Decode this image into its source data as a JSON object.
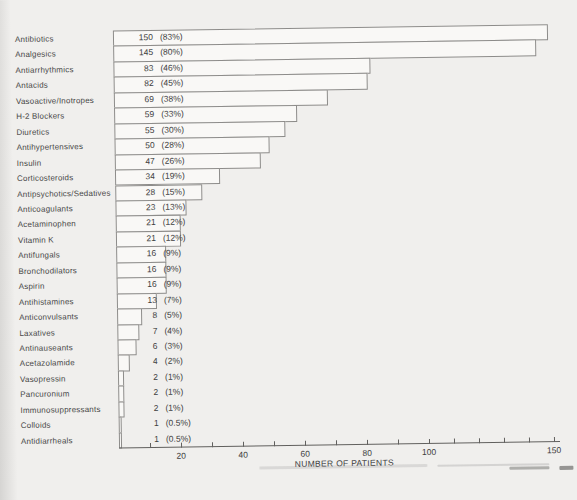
{
  "chart_data": {
    "type": "bar",
    "orientation": "horizontal",
    "title": "",
    "xlabel": "NUMBER OF PATIENTS",
    "ylabel": "",
    "xlim": [
      0,
      150
    ],
    "xticks_labeled": [
      20,
      40,
      60,
      80,
      100,
      150
    ],
    "xtick_minor_step": 10,
    "grid": false,
    "legend": false,
    "bar_fill_color": "#f9f8f6",
    "bar_border_color": "#8d8c8a",
    "rows": [
      {
        "category": "Antibiotics",
        "patients": 150,
        "pct_label": "(83%)"
      },
      {
        "category": "Analgesics",
        "patients": 145,
        "pct_label": "(80%)"
      },
      {
        "category": "Antiarrhythmics",
        "patients": 83,
        "pct_label": "(46%)"
      },
      {
        "category": "Antacids",
        "patients": 82,
        "pct_label": "(45%)"
      },
      {
        "category": "Vasoactive/Inotropes",
        "patients": 69,
        "pct_label": "(38%)"
      },
      {
        "category": "H-2 Blockers",
        "patients": 59,
        "pct_label": "(33%)"
      },
      {
        "category": "Diuretics",
        "patients": 55,
        "pct_label": "(30%)"
      },
      {
        "category": "Antihypertensives",
        "patients": 50,
        "pct_label": "(28%)"
      },
      {
        "category": "Insulin",
        "patients": 47,
        "pct_label": "(26%)"
      },
      {
        "category": "Corticosteroids",
        "patients": 34,
        "pct_label": "(19%)"
      },
      {
        "category": "Antipsychotics/Sedatives",
        "patients": 28,
        "pct_label": "(15%)"
      },
      {
        "category": "Anticoagulants",
        "patients": 23,
        "pct_label": "(13%)"
      },
      {
        "category": "Acetaminophen",
        "patients": 21,
        "pct_label": "(12%)"
      },
      {
        "category": "Vitamin K",
        "patients": 21,
        "pct_label": "(12%)"
      },
      {
        "category": "Antifungals",
        "patients": 16,
        "pct_label": "(9%)"
      },
      {
        "category": "Bronchodilators",
        "patients": 16,
        "pct_label": "(9%)"
      },
      {
        "category": "Aspirin",
        "patients": 16,
        "pct_label": "(9%)"
      },
      {
        "category": "Antihistamines",
        "patients": 13,
        "pct_label": "(7%)"
      },
      {
        "category": "Anticonvulsants",
        "patients": 8,
        "pct_label": "(5%)"
      },
      {
        "category": "Laxatives",
        "patients": 7,
        "pct_label": "(4%)"
      },
      {
        "category": "Antinauseants",
        "patients": 6,
        "pct_label": "(3%)"
      },
      {
        "category": "Acetazolamide",
        "patients": 4,
        "pct_label": "(2%)"
      },
      {
        "category": "Vasopressin",
        "patients": 2,
        "pct_label": "(1%)"
      },
      {
        "category": "Pancuronium",
        "patients": 2,
        "pct_label": "(1%)"
      },
      {
        "category": "Immunosuppressants",
        "patients": 2,
        "pct_label": "(1%)"
      },
      {
        "category": "Colloids",
        "patients": 1,
        "pct_label": "(0.5%)"
      },
      {
        "category": "Antidiarrheals",
        "patients": 1,
        "pct_label": "(0.5%)"
      }
    ]
  }
}
